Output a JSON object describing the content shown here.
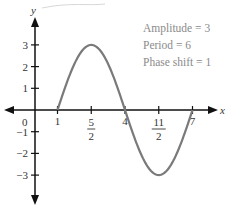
{
  "chart_data": {
    "type": "line",
    "title": "",
    "xlabel": "x",
    "ylabel": "y",
    "function": "y = 3 sin((π/3)(x − 1))",
    "x_range_plotted": [
      1,
      7
    ],
    "xlim": [
      -1.4,
      8.2
    ],
    "ylim": [
      -4.4,
      4.5
    ],
    "grid": false,
    "x_ticks": [
      {
        "value": 1,
        "label": "1"
      },
      {
        "value": 2.5,
        "label_num": "5",
        "label_den": "2"
      },
      {
        "value": 4,
        "label": "4"
      },
      {
        "value": 5.5,
        "label_num": "11",
        "label_den": "2"
      },
      {
        "value": 7,
        "label": "7"
      }
    ],
    "y_ticks": [
      {
        "value": 3,
        "label": "3"
      },
      {
        "value": 2,
        "label": "2"
      },
      {
        "value": 1,
        "label": "1"
      },
      {
        "value": -1,
        "label": "−1"
      },
      {
        "value": -2,
        "label": "−2"
      },
      {
        "value": -3,
        "label": "−3"
      }
    ],
    "origin_label": "0",
    "key_points": [
      {
        "x": 1,
        "y": 0
      },
      {
        "x": 2.5,
        "y": 3
      },
      {
        "x": 4,
        "y": 0
      },
      {
        "x": 5.5,
        "y": -3
      },
      {
        "x": 7,
        "y": 0
      }
    ],
    "annotations": [
      "Amplitude = 3",
      "Period = 6",
      "Phase shift = 1"
    ],
    "colors": {
      "curve": "#7a7a7a",
      "axes": "#111111",
      "annotation_text": "#8a8a8a"
    }
  }
}
